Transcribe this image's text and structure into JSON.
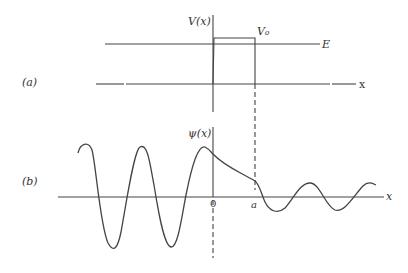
{
  "panel_a": {
    "label": "(a)",
    "y_label": "V(x)",
    "barrier_label": "V₀",
    "energy_label": "E",
    "x_label": "x"
  },
  "panel_b": {
    "label": "(b)",
    "y_label": "ψ(x)",
    "x_label": "x",
    "tick_0": "0",
    "tick_a": "a"
  },
  "colors": {
    "line": "#444444",
    "background": "#ffffff"
  }
}
